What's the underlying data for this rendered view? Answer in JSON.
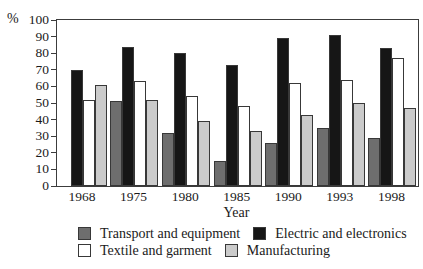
{
  "chart_data": {
    "type": "bar",
    "title": "",
    "ylabel": "%",
    "xlabel": "Year",
    "ylim": [
      0,
      100
    ],
    "ytick_step": 10,
    "grid": false,
    "legend_position": "bottom",
    "categories": [
      "1968",
      "1975",
      "1980",
      "1985",
      "1990",
      "1993",
      "1998"
    ],
    "series": [
      {
        "name": "Transport and equipment",
        "color": "#6e6e6e",
        "values": [
          null,
          51,
          32,
          15,
          26,
          35,
          29
        ]
      },
      {
        "name": "Electric and electronics",
        "color": "#161616",
        "values": [
          70,
          84,
          80,
          73,
          89,
          91,
          83
        ]
      },
      {
        "name": "Textile and garment",
        "color": "#ffffff",
        "values": [
          52,
          63,
          54,
          48,
          62,
          64,
          77
        ]
      },
      {
        "name": "Manufacturing",
        "color": "#cbcbcb",
        "values": [
          61,
          52,
          39,
          33,
          43,
          50,
          47
        ]
      }
    ],
    "axis_color": "#3c3c3c"
  }
}
